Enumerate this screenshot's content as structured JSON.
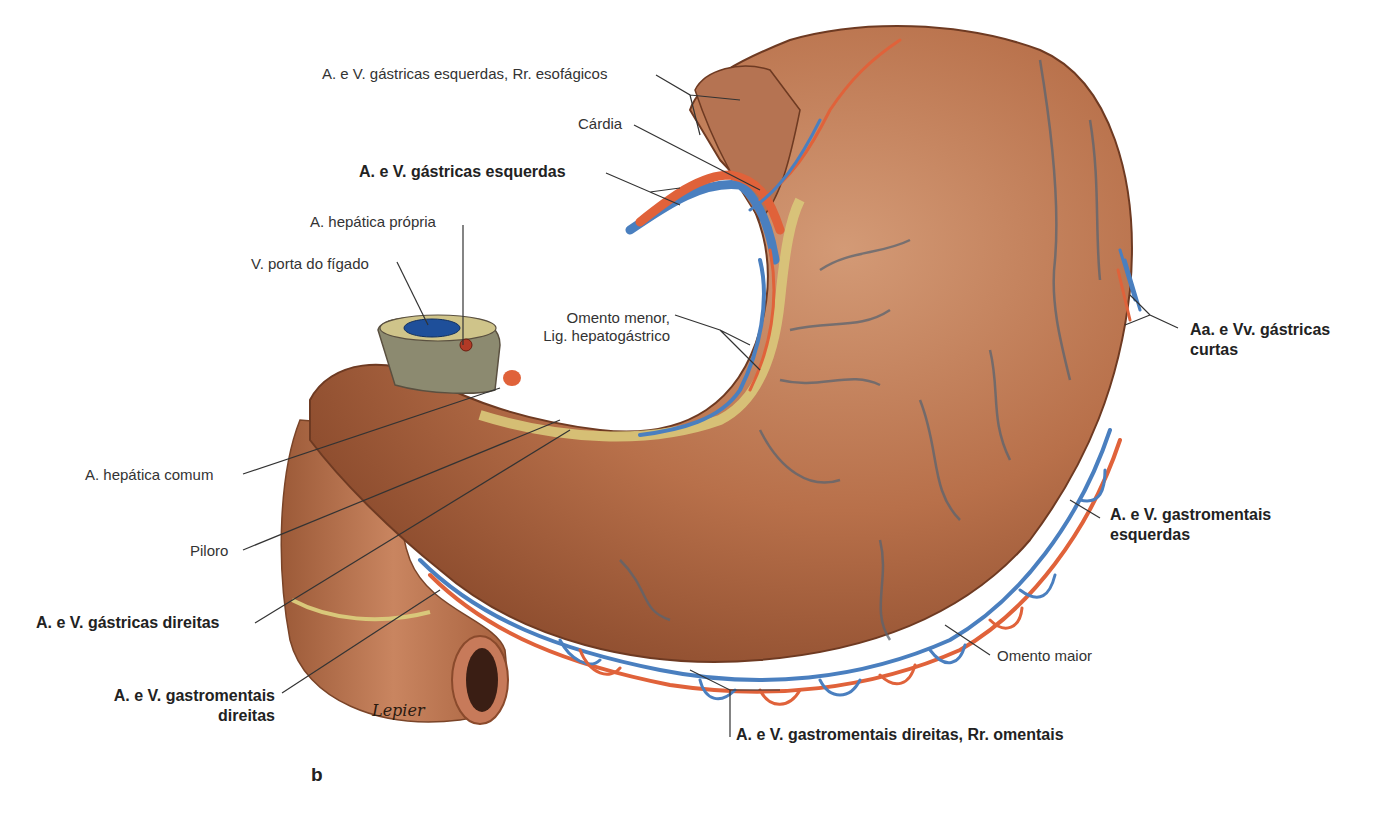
{
  "figure": {
    "panel_letter": "b",
    "signature": "Lepier",
    "colors": {
      "stomach": "#b8704a",
      "stomach_dark": "#8a4a2c",
      "artery": "#e0623a",
      "vein": "#4a7fbf",
      "omentum_fat": "#d9c87a",
      "leader_line": "#333333"
    }
  },
  "labels": {
    "esophageal_branches": "A. e V. gástricas esquerdas, Rr. esofágicos",
    "cardia": "Cárdia",
    "left_gastric": "A. e V. gástricas esquerdas",
    "proper_hepatic": "A. hepática própria",
    "portal_vein": "V. porta do fígado",
    "lesser_omentum_1": "Omento menor,",
    "lesser_omentum_2": "Lig. hepatogástrico",
    "short_gastric_1": "Aa. e Vv. gástricas",
    "short_gastric_2": "curtas",
    "common_hepatic": "A. hepática comum",
    "pylorus": "Piloro",
    "right_gastric": "A. e V. gástricas direitas",
    "left_gastroomental_1": "A. e V. gastromentais",
    "left_gastroomental_2": "esquerdas",
    "right_gastroomental_1": "A. e V. gastromentais",
    "right_gastroomental_2": "direitas",
    "greater_omentum": "Omento maior",
    "omental_branches": "A. e V. gastromentais direitas, Rr. omentais"
  }
}
